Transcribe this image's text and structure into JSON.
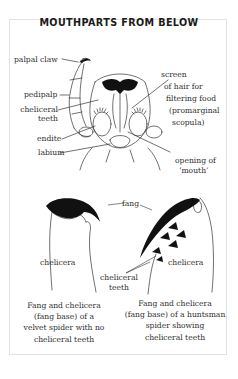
{
  "title": "MOUTHPARTS FROM BELOW",
  "top_diagram": {
    "labels": {
      "palpal_claw": "palpal claw",
      "pedipalp": "pedipalp",
      "cheliceral_teeth_1": "cheliceral",
      "cheliceral_teeth_2": "teeth",
      "endite": "endite",
      "labium": "labium",
      "screen_1": "screen",
      "screen_2": "of hair for",
      "screen_3": "filtering food",
      "screen_4": "(promarginal",
      "screen_5": "scopula)",
      "mouth_1": "opening of",
      "mouth_2": "‘mouth’"
    }
  },
  "bottom_diagram": {
    "labels": {
      "fang": "fang",
      "chelicera_left": "chelicera",
      "chelicera_right": "chelicera",
      "cheliceral_teeth_1": "cheliceral",
      "cheliceral_teeth_2": "teeth"
    },
    "captions": {
      "left": [
        "Fang and chelicera",
        "(fang base) of a",
        "velvet spider with no",
        "cheliceral teeth"
      ],
      "right": [
        "Fang and chelicera",
        "(fang base) of a huntsman",
        "spider showing",
        "cheliceral teeth"
      ]
    }
  }
}
